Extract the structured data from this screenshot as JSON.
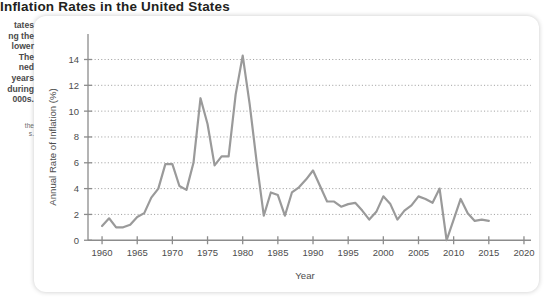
{
  "title": "Inflation Rates in the United States",
  "side_note": "tates\nng the\nlower\nThe\nned\nyears\nduring\n000s.",
  "side_caption": "the\ns.",
  "chart_data": {
    "type": "line",
    "title": "Inflation Rates in the United States",
    "xlabel": "Year",
    "ylabel": "Annual Rate of Inflation (%)",
    "xlim": [
      1958,
      2021
    ],
    "ylim": [
      -0.6,
      15.2
    ],
    "xticks": [
      1960,
      1965,
      1970,
      1975,
      1980,
      1985,
      1990,
      1995,
      2000,
      2005,
      2010,
      2015,
      2020
    ],
    "yticks": [
      0,
      2,
      4,
      6,
      8,
      10,
      12,
      14
    ],
    "grid": "horizontal-dotted",
    "legend": "none",
    "line_color": "#9a9a9a",
    "series": [
      {
        "name": "Annual Rate of Inflation (%)",
        "x": [
          1960,
          1961,
          1962,
          1963,
          1964,
          1965,
          1966,
          1967,
          1968,
          1969,
          1970,
          1971,
          1972,
          1973,
          1974,
          1975,
          1976,
          1977,
          1978,
          1979,
          1980,
          1981,
          1982,
          1983,
          1984,
          1985,
          1986,
          1987,
          1988,
          1989,
          1990,
          1991,
          1992,
          1993,
          1994,
          1995,
          1996,
          1997,
          1998,
          1999,
          2000,
          2001,
          2002,
          2003,
          2004,
          2005,
          2006,
          2007,
          2008,
          2009,
          2010,
          2011,
          2012,
          2013,
          2014,
          2015
        ],
        "values": [
          1.1,
          1.7,
          1.0,
          1.0,
          1.2,
          1.8,
          2.1,
          3.3,
          4.0,
          5.9,
          5.9,
          4.2,
          3.9,
          6.0,
          11.0,
          9.0,
          5.8,
          6.5,
          6.5,
          11.3,
          14.3,
          10.5,
          6.0,
          1.9,
          3.7,
          3.5,
          1.9,
          3.7,
          4.1,
          4.7,
          5.4,
          4.2,
          3.0,
          3.0,
          2.6,
          2.8,
          2.9,
          2.3,
          1.6,
          2.2,
          3.4,
          2.8,
          1.6,
          2.3,
          2.7,
          3.4,
          3.2,
          2.9,
          4.0,
          0.0,
          1.6,
          3.2,
          2.1,
          1.5,
          1.6,
          1.5
        ]
      }
    ]
  }
}
